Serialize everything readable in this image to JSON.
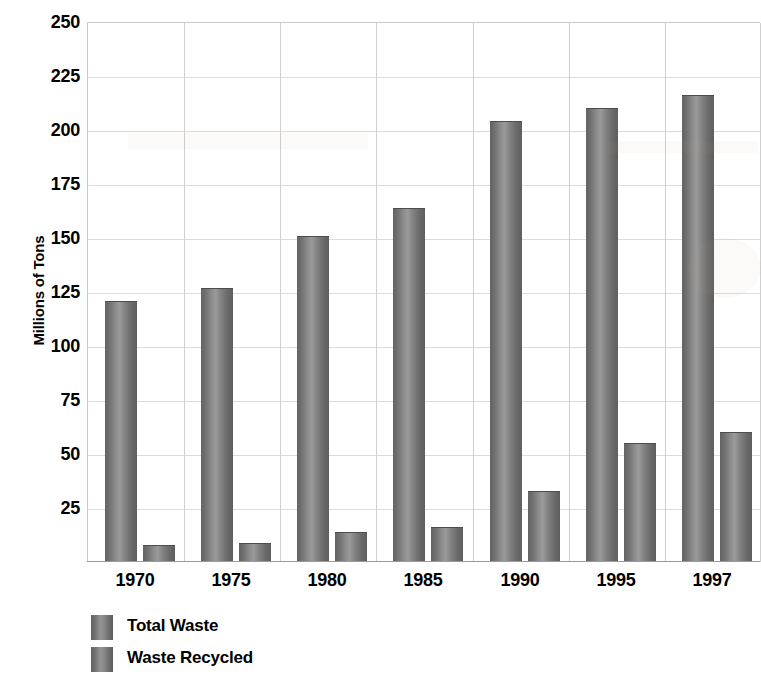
{
  "chart_data": {
    "type": "bar",
    "title": "",
    "subtitle": "",
    "xlabel": "",
    "ylabel": "Millions of Tons",
    "categories": [
      "1970",
      "1975",
      "1980",
      "1985",
      "1990",
      "1995",
      "1997"
    ],
    "series": [
      {
        "name": "Total Waste",
        "values": [
          121,
          127,
          151,
          164,
          204,
          210,
          216
        ],
        "color": "#7d7d7d"
      },
      {
        "name": "Waste Recycled",
        "values": [
          8,
          9,
          14,
          16,
          33,
          55,
          60
        ],
        "color": "#7d7d7d"
      }
    ],
    "ylim": [
      0,
      250
    ],
    "ytick_values": [
      25,
      50,
      75,
      100,
      125,
      150,
      175,
      200,
      225,
      250
    ],
    "ytick_labels": [
      "25",
      "50",
      "75",
      "100",
      "125",
      "150",
      "175",
      "200",
      "225",
      "250"
    ],
    "grid": {
      "horizontal": true,
      "vertical": true
    },
    "legend": {
      "position": "bottom-left",
      "entries": [
        "Total Waste",
        "Waste Recycled"
      ]
    },
    "annotations": []
  },
  "axis": {
    "y_title": "Millions of Tons"
  },
  "legend": {
    "entries": [
      {
        "label": "Total Waste"
      },
      {
        "label": "Waste Recycled"
      }
    ]
  }
}
